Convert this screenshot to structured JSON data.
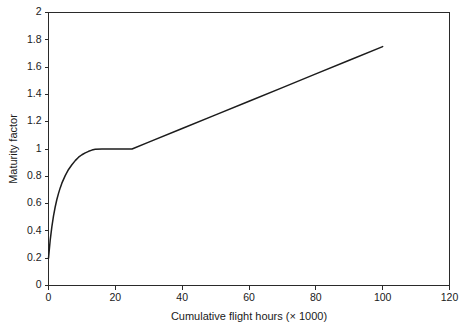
{
  "chart_data": {
    "type": "line",
    "title": "",
    "xlabel": "Cumulative flight hours (× 1000)",
    "ylabel": "Maturity factor",
    "xlim": [
      0,
      120
    ],
    "ylim": [
      0,
      2
    ],
    "grid": false,
    "legend": null,
    "x_ticks": [
      0,
      20,
      40,
      60,
      80,
      100,
      120
    ],
    "x_tick_labels": [
      "0",
      "20",
      "40",
      "60",
      "80",
      "100",
      "120"
    ],
    "y_ticks": [
      0,
      0.2,
      0.4,
      0.6,
      0.8,
      1,
      1.2,
      1.4,
      1.6,
      1.8,
      2
    ],
    "y_tick_labels": [
      "0",
      "0.2",
      "0.4",
      "0.6",
      "0.8",
      "1",
      "1.2",
      "1.4",
      "1.6",
      "1.8",
      "2"
    ],
    "series": [
      {
        "name": "Maturity factor",
        "color": "#1c1c1c",
        "x": [
          0,
          0.5,
          1,
          1.5,
          2,
          2.5,
          3,
          3.5,
          4,
          5,
          6,
          7,
          8,
          9,
          10,
          11,
          12,
          13,
          14,
          16,
          18,
          20,
          22,
          25,
          30,
          40,
          50,
          60,
          70,
          80,
          90,
          100
        ],
        "y": [
          0.2,
          0.33,
          0.43,
          0.51,
          0.575,
          0.63,
          0.675,
          0.715,
          0.75,
          0.805,
          0.85,
          0.885,
          0.915,
          0.94,
          0.958,
          0.972,
          0.983,
          0.992,
          0.998,
          1.0,
          1.0,
          1.0,
          1.0,
          1.0,
          1.05,
          1.15,
          1.25,
          1.35,
          1.45,
          1.55,
          1.65,
          1.75
        ]
      }
    ],
    "annotations": [
      "Curve rises steeply from 0.2 at 0 to a plateau of 1.0 near 14",
      "Plateau held at 1.0 from about 14 to 25",
      "Linear rise from 1.0 at 25 to 1.75 at 100"
    ]
  },
  "axes": {
    "x_label": "Cumulative flight hours (× 1000)",
    "y_label": "Maturity factor"
  },
  "colors": {
    "line": "#1c1c1c",
    "axis": "#2a2a2a",
    "background": "#ffffff",
    "text": "#1a1a1a"
  }
}
